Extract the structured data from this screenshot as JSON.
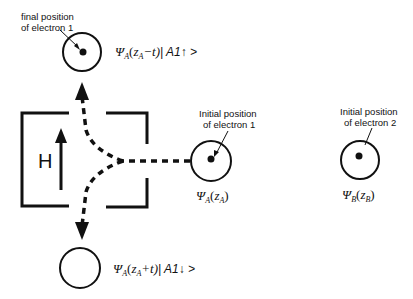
{
  "diagram": {
    "field_label": "H",
    "labels": {
      "final_position": [
        "final position",
        "of  electron 1"
      ],
      "initial_electron1": [
        "Initial position",
        "of  electron 1"
      ],
      "initial_electron2": [
        "Initial position",
        "of  electron 2"
      ]
    },
    "wavefunctions": {
      "up": {
        "psi": "Ψ",
        "sub": "A",
        "open": "(",
        "z": "z",
        "zsub": "A",
        "rest": "−t)",
        "ket": "| A1↑ >"
      },
      "down": {
        "psi": "Ψ",
        "sub": "A",
        "open": "(",
        "z": "z",
        "zsub": "A",
        "rest": "+t)",
        "ket": "| A1↓ >"
      },
      "a": {
        "psi": "Ψ",
        "sub": "A",
        "open": "(",
        "z": "z",
        "zsub": "A",
        "rest": ")"
      },
      "b": {
        "psi": "Ψ",
        "sub": "B",
        "open": "(",
        "z": "z",
        "zsub": "B",
        "rest": ")"
      }
    },
    "colors": {
      "stroke": "#111111",
      "background": "#ffffff"
    }
  }
}
